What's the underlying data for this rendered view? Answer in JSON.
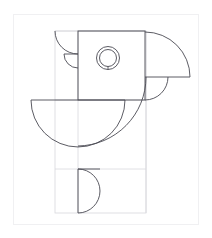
{
  "artwork": {
    "title": "Geometric Parrot Line Drawing",
    "canvas": {
      "width": 212,
      "height": 238,
      "background": "#ffffff"
    },
    "colors": {
      "main_stroke": "#4a4a52",
      "guide_stroke": "#d8d8dd",
      "frame_stroke": "#f0f0f2"
    },
    "frame": {
      "x": 13,
      "y": 14,
      "width": 185,
      "height": 210
    },
    "guides": {
      "body_rect": {
        "x": 55,
        "y": 31,
        "width": 91,
        "height": 182
      },
      "vertical_axis_x": 78,
      "horizontal_axis_y": 100,
      "head_right_x": 146,
      "head_bottom_y": 100
    },
    "shapes": [
      {
        "name": "head-rectangle",
        "type": "rectangle",
        "x": 78,
        "y": 31,
        "width": 67,
        "height": 69,
        "stroke": "main"
      },
      {
        "name": "beak-upper-arc",
        "type": "quarter-arc",
        "center_x": 145,
        "center_y": 100,
        "radius": 45,
        "start_angle": 270,
        "end_angle": 360,
        "stroke": "main"
      },
      {
        "name": "beak-base-line",
        "type": "line",
        "x1": 145,
        "y1": 77,
        "x2": 190,
        "y2": 77,
        "stroke": "main"
      },
      {
        "name": "beak-lower-arc",
        "type": "quarter-arc",
        "center_x": 145,
        "center_y": 77,
        "radius": 23,
        "start_angle": 0,
        "end_angle": 90,
        "stroke": "main"
      },
      {
        "name": "eye-outer-circle",
        "type": "circle",
        "center_x": 108,
        "center_y": 58,
        "radius": 11,
        "stroke": "main"
      },
      {
        "name": "eye-inner-circle",
        "type": "circle",
        "center_x": 108,
        "center_y": 58,
        "radius": 8,
        "stroke": "main"
      },
      {
        "name": "crest-upper-arc",
        "type": "quarter-arc",
        "center_x": 78,
        "center_y": 31,
        "radius": 23,
        "start_angle": 90,
        "end_angle": 180,
        "stroke": "main"
      },
      {
        "name": "crest-lower-arc",
        "type": "quarter-arc",
        "center_x": 78,
        "center_y": 54,
        "radius": 14,
        "start_angle": 90,
        "end_angle": 180,
        "stroke": "main"
      },
      {
        "name": "crest-divider-line",
        "type": "line",
        "x1": 64,
        "y1": 54,
        "x2": 78,
        "y2": 54,
        "stroke": "main"
      },
      {
        "name": "body-semicircle",
        "type": "half-circle",
        "center_x": 78,
        "center_y": 100,
        "radius": 47,
        "orientation": "down",
        "stroke": "main"
      },
      {
        "name": "body-top-line",
        "type": "line",
        "x1": 31,
        "y1": 100,
        "x2": 125,
        "y2": 100,
        "stroke": "main"
      },
      {
        "name": "wing-large-arc",
        "type": "quarter-arc",
        "center_x": 78,
        "center_y": 77,
        "radius": 68,
        "start_angle": 0,
        "end_angle": 90,
        "stroke": "main"
      },
      {
        "name": "tail-semicircle",
        "type": "half-circle",
        "center_x": 78,
        "center_y": 191,
        "radius": 22,
        "orientation": "right",
        "stroke": "main"
      },
      {
        "name": "tail-top-line",
        "type": "line",
        "x1": 78,
        "y1": 169,
        "x2": 100,
        "y2": 169,
        "stroke": "main"
      }
    ]
  }
}
